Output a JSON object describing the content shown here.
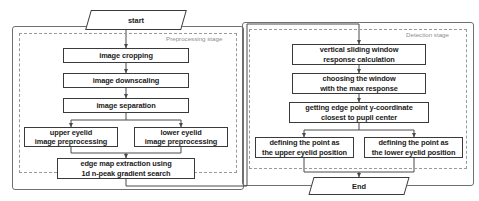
{
  "diagram": {
    "stages": [
      {
        "id": "preprocessing",
        "label": "Preprocessing stage"
      },
      {
        "id": "detection",
        "label": "Detection stage"
      }
    ],
    "terminators": [
      {
        "id": "start",
        "label": "start"
      },
      {
        "id": "end",
        "label": "End"
      }
    ],
    "preprocessing_nodes": [
      {
        "id": "image-cropping",
        "label": "image cropping"
      },
      {
        "id": "image-downscaling",
        "label": "image downscaling"
      },
      {
        "id": "image-separation",
        "label": "image separation"
      },
      {
        "id": "upper-eyelid-preprocessing",
        "label": "upper eyelid\nimage preprocessing"
      },
      {
        "id": "lower-eyelid-preprocessing",
        "label": "lower eyelid\nimage preprocessing"
      },
      {
        "id": "edge-map-extraction",
        "label": "edge map extraction using\n1d n-peak gradient search"
      }
    ],
    "detection_nodes": [
      {
        "id": "vertical-sliding-window",
        "label": "vertical sliding window\nresponse calculation"
      },
      {
        "id": "choosing-max-window",
        "label": "choosing the window\nwith the max response"
      },
      {
        "id": "edge-point-y-coordinate",
        "label": "getting edge point y-coordinate\nclosest to pupil center"
      },
      {
        "id": "define-upper-eyelid",
        "label": "defining the point as\nthe upper eyelid position"
      },
      {
        "id": "define-lower-eyelid",
        "label": "defining the point as\nthe lower eyelid position"
      }
    ],
    "colors": {
      "node_border": "#3a3a3a",
      "stage_border": "#9a9a9a",
      "outer_border": "#6f6f6f",
      "connector": "#4a4a4a",
      "text": "#1b1b1b",
      "stage_label_text": "#8d8d8d",
      "background": "#ffffff"
    }
  }
}
